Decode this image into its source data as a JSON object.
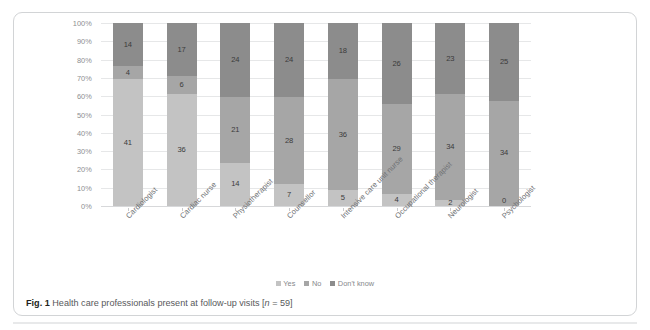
{
  "caption": {
    "fig_label": "Fig. 1",
    "text": " Health care professionals present at follow-up visits [",
    "n_italic": "n",
    "n_value": " = 59]"
  },
  "legend": {
    "position": "bottom-center",
    "items": [
      {
        "label": "Yes",
        "color": "#c3c3c3"
      },
      {
        "label": "No",
        "color": "#a6a6a6"
      },
      {
        "label": "Don't know",
        "color": "#8c8c8c"
      }
    ]
  },
  "axis": {
    "y_ticks": [
      "100%",
      "90%",
      "80%",
      "70%",
      "60%",
      "50%",
      "40%",
      "30%",
      "20%",
      "10%",
      "0%"
    ]
  },
  "chart_data": {
    "type": "bar",
    "stacked": true,
    "normalized": true,
    "title": "Health care professionals present at follow-up visits [n = 59]",
    "xlabel": "",
    "ylabel": "",
    "ylim": [
      0,
      100
    ],
    "ytick_labels": [
      "0%",
      "10%",
      "20%",
      "30%",
      "40%",
      "50%",
      "60%",
      "70%",
      "80%",
      "90%",
      "100%"
    ],
    "grid": true,
    "total_per_category": 59,
    "categories": [
      "Cardiologist",
      "Cardiac nurse",
      "Physiotherapist",
      "Counsellor",
      "Intensive care unit nurse",
      "Occupational therapist",
      "Neurologist",
      "Psychologist"
    ],
    "series": [
      {
        "name": "Yes",
        "color": "#c3c3c3",
        "values": [
          41,
          36,
          14,
          7,
          5,
          4,
          2,
          0
        ]
      },
      {
        "name": "No",
        "color": "#a6a6a6",
        "values": [
          4,
          6,
          21,
          28,
          36,
          29,
          34,
          34
        ]
      },
      {
        "name": "Don't know",
        "color": "#8c8c8c",
        "values": [
          14,
          17,
          24,
          24,
          18,
          26,
          23,
          25
        ]
      }
    ]
  }
}
